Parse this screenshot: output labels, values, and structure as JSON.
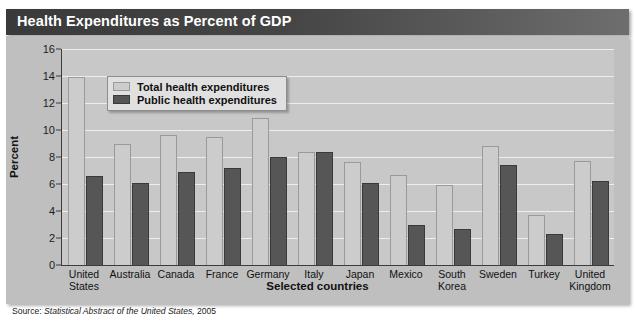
{
  "title": "Health Expenditures as Percent of GDP",
  "source": {
    "label": "Source:",
    "publication": "Statistical Abstract of the United States,",
    "year": "2005"
  },
  "legend": {
    "items": [
      {
        "label": "Total health expenditures",
        "color": "#cccccc"
      },
      {
        "label": "Public health expenditures",
        "color": "#565656"
      }
    ]
  },
  "chart_data": {
    "type": "bar",
    "title": "Health Expenditures as Percent of GDP",
    "xlabel": "Selected countries",
    "ylabel": "Percent",
    "ylim": [
      0,
      16
    ],
    "yticks": [
      0,
      2,
      4,
      6,
      8,
      10,
      12,
      14,
      16
    ],
    "ytick_labels": [
      "0",
      "2",
      "4",
      "6",
      "8",
      "10",
      "12",
      "14",
      "16"
    ],
    "grid": true,
    "legend_position": "upper-left-inside",
    "categories": [
      "United States",
      "Australia",
      "Canada",
      "France",
      "Germany",
      "Italy",
      "Japan",
      "Mexico",
      "South Korea",
      "Sweden",
      "Turkey",
      "United Kingdom"
    ],
    "category_lines": [
      [
        "United",
        "States"
      ],
      [
        "Australia"
      ],
      [
        "Canada"
      ],
      [
        "France"
      ],
      [
        "Germany"
      ],
      [
        "Italy"
      ],
      [
        "Japan"
      ],
      [
        "Mexico"
      ],
      [
        "South",
        "Korea"
      ],
      [
        "Sweden"
      ],
      [
        "Turkey"
      ],
      [
        "United",
        "Kingdom"
      ]
    ],
    "series": [
      {
        "name": "Total health expenditures",
        "color": "#cccccc",
        "values": [
          13.9,
          9.0,
          9.6,
          9.5,
          10.9,
          8.4,
          7.6,
          6.7,
          5.9,
          8.8,
          3.7,
          7.7
        ]
      },
      {
        "name": "Public health expenditures",
        "color": "#565656",
        "values": [
          6.6,
          6.1,
          6.9,
          7.2,
          8.0,
          8.4,
          6.1,
          3.0,
          2.7,
          7.4,
          2.3,
          6.2
        ]
      }
    ]
  }
}
